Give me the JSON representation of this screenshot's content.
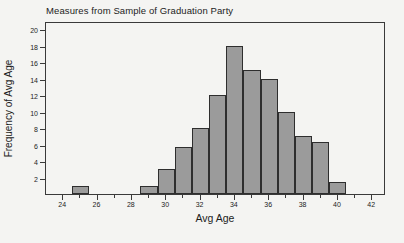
{
  "chart_data": {
    "type": "bar",
    "title": "Measures from Sample of Graduation Party",
    "xlabel": "Avg Age",
    "ylabel": "Frequency of Avg Age",
    "xlim": [
      23,
      42.8
    ],
    "ylim": [
      0,
      21
    ],
    "grid": false,
    "legend": null,
    "bin_width": 1,
    "categories": [
      25,
      29,
      30,
      31,
      32,
      33,
      34,
      35,
      36,
      37,
      38,
      39,
      40
    ],
    "values": [
      1,
      1,
      3,
      5.7,
      8,
      12,
      18,
      15,
      14,
      10,
      7,
      6.3,
      1.4
    ],
    "bars": [
      {
        "center": 25,
        "left": 24.5,
        "right": 25.5,
        "value": 1
      },
      {
        "center": 29,
        "left": 28.5,
        "right": 29.5,
        "value": 1
      },
      {
        "center": 30,
        "left": 29.5,
        "right": 30.5,
        "value": 3
      },
      {
        "center": 31,
        "left": 30.5,
        "right": 31.5,
        "value": 5.7
      },
      {
        "center": 32,
        "left": 31.5,
        "right": 32.5,
        "value": 8
      },
      {
        "center": 33,
        "left": 32.5,
        "right": 33.5,
        "value": 12
      },
      {
        "center": 34,
        "left": 33.5,
        "right": 34.5,
        "value": 18
      },
      {
        "center": 35,
        "left": 34.5,
        "right": 35.5,
        "value": 15
      },
      {
        "center": 36,
        "left": 35.5,
        "right": 36.5,
        "value": 14
      },
      {
        "center": 37,
        "left": 36.5,
        "right": 37.5,
        "value": 10
      },
      {
        "center": 38,
        "left": 37.5,
        "right": 38.5,
        "value": 7
      },
      {
        "center": 39,
        "left": 38.5,
        "right": 39.5,
        "value": 6.3
      },
      {
        "center": 40,
        "left": 39.5,
        "right": 40.5,
        "value": 1.4
      }
    ],
    "yticks": [
      2,
      4,
      6,
      8,
      10,
      12,
      14,
      16,
      18,
      20
    ],
    "xticks_major": [
      24,
      26,
      28,
      30,
      32,
      34,
      36,
      38,
      40,
      42
    ],
    "xticks_minor": [
      25,
      27,
      29,
      31,
      33,
      35,
      37,
      39,
      41
    ],
    "colors": {
      "bar_fill": "#9b9b9b",
      "bar_border": "#2e2e2e",
      "axis": "#3a3a3a",
      "text": "#1c1c1c",
      "background": "#f4f4f2"
    }
  }
}
